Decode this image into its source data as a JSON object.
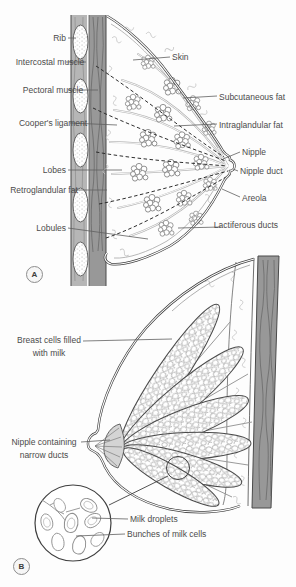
{
  "figure": {
    "title_hint": "Breast anatomy diagram, panels A and B",
    "colors": {
      "line": "#3f3f3f",
      "muscle_dark": "#989898",
      "muscle_light": "#b6b6b6",
      "duct_gray": "#b3b3b3",
      "label_text": "#4b4b4b"
    },
    "panel_a": {
      "badge": "A",
      "labels": {
        "rib": "Rib",
        "intercostal_muscle": "Intercostal muscle",
        "pectoral_muscle": "Pectoral muscle",
        "coopers_ligament": "Cooper's ligament",
        "lobes": "Lobes",
        "retroglandular_fat": "Retroglandular fat",
        "lobules": "Lobules",
        "skin": "Skin",
        "subcutaneous_fat": "Subcutaneous fat",
        "intraglandular_fat": "Intraglandular fat",
        "nipple": "Nipple",
        "nipple_duct": "Nipple duct",
        "areola": "Areola",
        "lactiferous_ducts": "Lactiferous ducts"
      }
    },
    "panel_b": {
      "badge": "B",
      "labels": {
        "breast_cells": "Breast cells filled with milk",
        "nipple_narrow_ducts": "Nipple containing narrow ducts",
        "milk_droplets": "Milk droplets",
        "bunches_milk_cells": "Bunches of milk cells"
      }
    }
  }
}
